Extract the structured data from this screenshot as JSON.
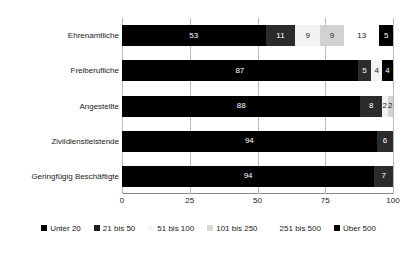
{
  "chart_data": {
    "type": "bar",
    "orientation": "horizontal",
    "stacked": true,
    "stack_mode": "percent",
    "title": "",
    "subtitle": "",
    "xlabel": "",
    "ylabel": "",
    "xlim": [
      0,
      100
    ],
    "xticks": [
      0,
      25,
      50,
      75,
      100
    ],
    "xtick_labels": [
      "0",
      "25",
      "50",
      "75",
      "100"
    ],
    "grid": true,
    "grid_axis": "x",
    "legend_position": "bottom",
    "categories": [
      "Ehrenamtliche",
      "Freiberufliche",
      "Angestellte",
      "Zivildienstleistende",
      "Geringfügig Beschäftigte"
    ],
    "series": [
      {
        "name": "Unter 20",
        "color": "#000000",
        "values": [
          53,
          87,
          88,
          94,
          94
        ]
      },
      {
        "name": "21 bis 50",
        "color": "#2b2b2b",
        "values": [
          11,
          5,
          8,
          6,
          7
        ]
      },
      {
        "name": "51 bis 100",
        "color": "#f2f2f2",
        "values": [
          9,
          4,
          2,
          0,
          0
        ]
      },
      {
        "name": "101 bis 250",
        "color": "#d2d2d2",
        "values": [
          9,
          0,
          2,
          0,
          0
        ]
      },
      {
        "name": "251 bis 500",
        "color": "#ffffff",
        "values": [
          13,
          0,
          0,
          0,
          0
        ]
      },
      {
        "name": "Über 500",
        "color": "#000000",
        "values": [
          5,
          4,
          0,
          0,
          0
        ]
      }
    ],
    "bar_labels": [
      [
        "53",
        "11",
        "9",
        "9",
        "13",
        "5"
      ],
      [
        "87",
        "5",
        "4",
        "",
        "",
        "4"
      ],
      [
        "88",
        "8",
        "2",
        "2",
        "",
        ""
      ],
      [
        "94",
        "6",
        "",
        "",
        "",
        ""
      ],
      [
        "94",
        "7",
        "",
        "",
        "",
        ""
      ]
    ]
  },
  "legend": {
    "items": [
      {
        "label": "Unter 20",
        "swatch": "legend-swatch-unter-20"
      },
      {
        "label": "21 bis 50",
        "swatch": "legend-swatch-21-bis-50"
      },
      {
        "label": "51 bis 100",
        "swatch": "legend-swatch-51-bis-100"
      },
      {
        "label": "101 bis 250",
        "swatch": "legend-swatch-101-bis-250"
      },
      {
        "label": "251 bis 500",
        "swatch": "legend-swatch-251-bis-500"
      },
      {
        "label": "Über 500",
        "swatch": "legend-swatch-ueber-500"
      }
    ]
  }
}
